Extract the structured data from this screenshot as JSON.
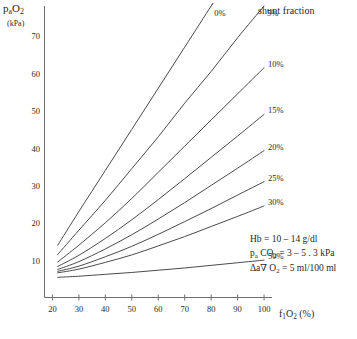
{
  "chart_data": {
    "type": "line",
    "title": "shunt fraction",
    "xlabel": "f₁O₂ (%)",
    "ylabel": "pₐO₂",
    "yunit": "(kPa)",
    "xlim": [
      17,
      103
    ],
    "ylim": [
      0,
      78
    ],
    "xticks": [
      20,
      30,
      40,
      50,
      60,
      70,
      80,
      90,
      100
    ],
    "yticks": [
      10,
      20,
      30,
      40,
      50,
      60,
      70
    ],
    "grid": false,
    "legend_position": "inline-right-of-curve-ends",
    "x": [
      22,
      30,
      40,
      50,
      60,
      70,
      80,
      90,
      100
    ],
    "series": [
      {
        "name": "0%",
        "label": "0%",
        "values": [
          14.0,
          23.0,
          34.0,
          45.0,
          56.0,
          67.0,
          78.0,
          89.0,
          100.0
        ]
      },
      {
        "name": "5%",
        "label": "5%",
        "values": [
          11.5,
          18.0,
          26.0,
          34.5,
          43.0,
          52.0,
          60.5,
          69.5,
          78.0
        ]
      },
      {
        "name": "10%",
        "label": "10%",
        "values": [
          9.5,
          14.0,
          20.0,
          26.5,
          33.5,
          40.5,
          47.5,
          54.5,
          61.5
        ]
      },
      {
        "name": "15%",
        "label": "15%",
        "values": [
          8.3,
          11.3,
          15.8,
          20.8,
          26.2,
          31.8,
          37.5,
          43.2,
          49.0
        ]
      },
      {
        "name": "20%",
        "label": "20%",
        "values": [
          7.5,
          9.6,
          13.0,
          16.8,
          21.0,
          25.4,
          30.0,
          34.6,
          39.3
        ]
      },
      {
        "name": "25%",
        "label": "25%",
        "values": [
          7.0,
          8.4,
          10.9,
          13.7,
          16.9,
          20.3,
          23.8,
          27.4,
          31.0
        ]
      },
      {
        "name": "30%",
        "label": "30%",
        "values": [
          6.6,
          7.6,
          9.4,
          11.4,
          13.8,
          16.3,
          19.0,
          21.7,
          24.5
        ]
      },
      {
        "name": "50%",
        "label": "50%",
        "values": [
          5.4,
          5.7,
          6.2,
          6.7,
          7.3,
          7.9,
          8.6,
          9.3,
          10.0
        ]
      }
    ],
    "annotations": [
      "Hb = 10 – 14 g/dl",
      "pₐ CO₂ = 3 – 5 . 3 kPa",
      "Δa∇ O₂ = 5 ml/100 ml"
    ]
  },
  "axes": {
    "y": {
      "label_main": "pₐO₂",
      "label_unit": "(kPa)",
      "ticks": [
        "70",
        "60",
        "50",
        "40",
        "30",
        "20",
        "10"
      ]
    },
    "x": {
      "label": "f₁O₂ (%)",
      "ticks": [
        "20",
        "30",
        "40",
        "50",
        "60",
        "70",
        "80",
        "90",
        "100"
      ]
    }
  },
  "title": "shunt fraction",
  "curve_labels": [
    "0%",
    "5%",
    "10%",
    "15%",
    "20%",
    "25%",
    "30%",
    "50%"
  ],
  "notes": {
    "line1": "Hb = 10 – 14 g/dl",
    "line2_prefix": "p",
    "line2_sub": "a",
    "line2_rest": " CO₂ = 3 – 5 . 3 kPa",
    "line3": "Δa∇ O₂ = 5 ml/100 ml"
  },
  "colors": {
    "curve": "#4a4a4a",
    "axis": "#6e6e6e",
    "text": "#1f1f1f",
    "background": "#ffffff"
  }
}
